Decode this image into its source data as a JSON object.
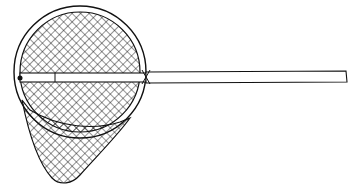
{
  "image": {
    "subject": "landing net line drawing",
    "style": "black ink sketch on white",
    "colors": {
      "background": "#ffffff",
      "ink": "#111111"
    }
  }
}
